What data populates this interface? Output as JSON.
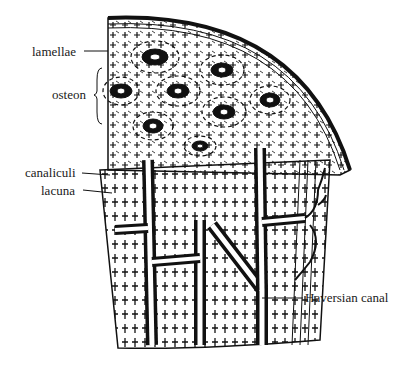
{
  "diagram": {
    "labels": {
      "lamellae": "lamellae",
      "osteon": "osteon",
      "canaliculi": "canaliculi",
      "lacuna": "lacuna",
      "haversian_canal": "Haversian canal"
    },
    "colors": {
      "ink": "#111111",
      "paper": "#ffffff"
    }
  }
}
